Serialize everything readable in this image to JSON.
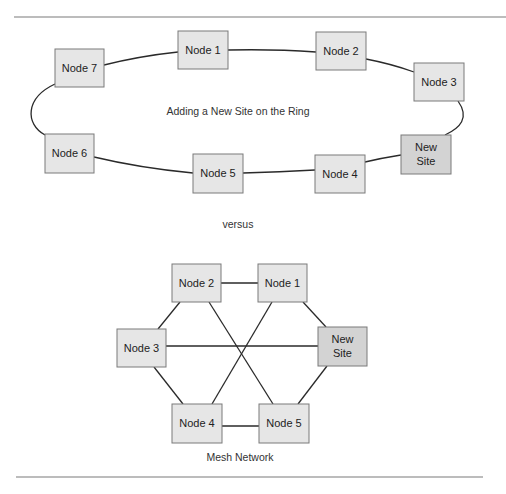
{
  "colors": {
    "node_fill": "#e6e6e6",
    "new_site_fill": "#d3d3d3",
    "node_border": "#7a7a7a",
    "link": "#2a2a2a",
    "rule": "#7a7a7a"
  },
  "ring": {
    "caption": "Adding a New Site on the Ring",
    "nodes": [
      {
        "id": "n1",
        "label": "Node 1",
        "x": 178,
        "y": 31,
        "w": 50,
        "h": 38
      },
      {
        "id": "n2",
        "label": "Node 2",
        "x": 316,
        "y": 32,
        "w": 50,
        "h": 38
      },
      {
        "id": "n3",
        "label": "Node 3",
        "x": 414,
        "y": 63,
        "w": 50,
        "h": 38
      },
      {
        "id": "new",
        "label_line1": "New",
        "label_line2": "Site",
        "x": 401,
        "y": 135,
        "w": 50,
        "h": 39
      },
      {
        "id": "n4",
        "label": "Node 4",
        "x": 315,
        "y": 155,
        "w": 50,
        "h": 38
      },
      {
        "id": "n5",
        "label": "Node 5",
        "x": 193,
        "y": 154,
        "w": 50,
        "h": 39
      },
      {
        "id": "n6",
        "label": "Node 6",
        "x": 45,
        "y": 134,
        "w": 49,
        "h": 39
      },
      {
        "id": "n7",
        "label": "Node 7",
        "x": 55,
        "y": 49,
        "w": 49,
        "h": 38
      }
    ]
  },
  "separator_text": "versus",
  "mesh": {
    "caption": "Mesh Network",
    "nodes": [
      {
        "id": "m2",
        "label": "Node 2",
        "x": 172,
        "y": 264,
        "w": 49,
        "h": 38
      },
      {
        "id": "m1",
        "label": "Node 1",
        "x": 258,
        "y": 264,
        "w": 49,
        "h": 38
      },
      {
        "id": "m3",
        "label": "Node 3",
        "x": 117,
        "y": 329,
        "w": 49,
        "h": 38
      },
      {
        "id": "mnew",
        "label_line1": "New",
        "label_line2": "Site",
        "x": 318,
        "y": 327,
        "w": 49,
        "h": 39
      },
      {
        "id": "m4",
        "label": "Node 4",
        "x": 172,
        "y": 404,
        "w": 50,
        "h": 39
      },
      {
        "id": "m5",
        "label": "Node 5",
        "x": 259,
        "y": 404,
        "w": 50,
        "h": 39
      }
    ],
    "links": [
      [
        "Node 2",
        "Node 1"
      ],
      [
        "Node 2",
        "Node 3"
      ],
      [
        "Node 2",
        "Node 5"
      ],
      [
        "Node 1",
        "Node 4"
      ],
      [
        "Node 1",
        "New Site"
      ],
      [
        "Node 3",
        "New Site"
      ],
      [
        "Node 3",
        "Node 4"
      ],
      [
        "New Site",
        "Node 5"
      ],
      [
        "Node 4",
        "Node 5"
      ]
    ]
  }
}
